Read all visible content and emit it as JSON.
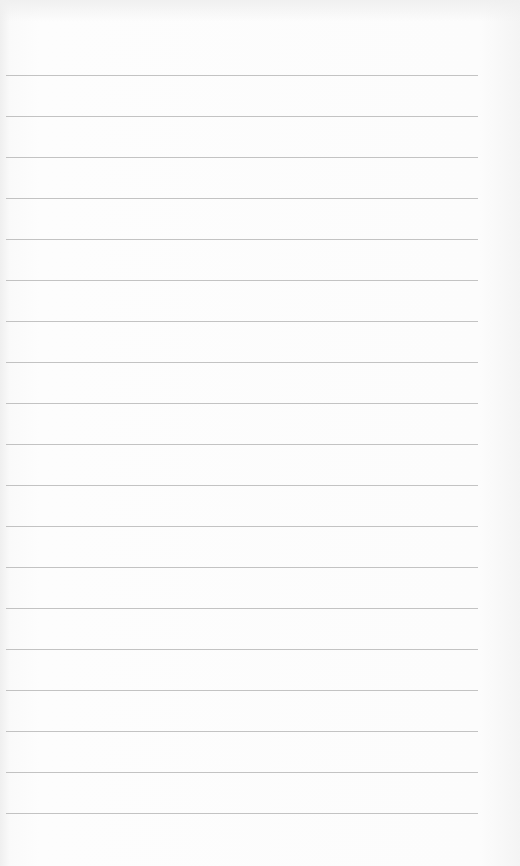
{
  "page": {
    "type": "blank lined notepad sheet",
    "line_count": 19,
    "first_line_y": 75,
    "line_spacing": 41,
    "line_color": "#b4b4b4",
    "paper_color": "#fbfbfb"
  }
}
